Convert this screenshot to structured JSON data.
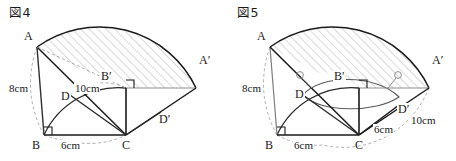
{
  "page": {
    "background_color": "#ffffff",
    "ink_color": "#1a1a1a",
    "construction_color": "#8a8a8a",
    "hatch_color": "#9a9a9a",
    "width": 456,
    "height": 161
  },
  "figures": [
    {
      "id": "fig4",
      "caption": "図4",
      "vertices": {
        "A": "A",
        "A_prime": "A′",
        "B": "B",
        "B_prime": "B′",
        "C": "C",
        "D": "D",
        "D_prime": "D′"
      },
      "dimensions": {
        "side_AB": "8cm",
        "base_BC": "6cm",
        "slant_CA": "10cm"
      },
      "marks": {
        "right_angle_at_B": "right-angle",
        "right_angle_at_B_prime": "right-angle"
      },
      "description": "Right triangle ABC rotated about C to A'B'C with hatched swept sector"
    },
    {
      "id": "fig5",
      "caption": "図5",
      "vertices": {
        "A": "A",
        "A_prime": "A′",
        "B": "B",
        "B_prime": "B′",
        "C": "C",
        "D": "D",
        "D_prime": "D′"
      },
      "dimensions": {
        "side_AB": "8cm",
        "base_BC": "6cm",
        "segment_CD_prime": "6cm",
        "slant_CA_prime": "10cm"
      },
      "marks": {
        "right_angle_at_B": "right-angle",
        "right_angle_at_B_prime": "right-angle",
        "tick_at_D": "circle-tick",
        "tick_at_D_prime": "circle-tick"
      },
      "description": "Right triangle ABC rotated about C with ellipse traced by point D and hatched swept sector"
    }
  ]
}
